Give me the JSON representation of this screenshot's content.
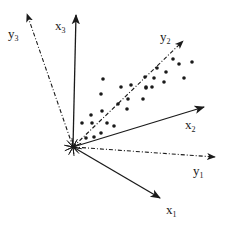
{
  "diagram": {
    "type": "coordinate-axes-rotation",
    "colors": {
      "ink": "#1a1a1a",
      "background": "#ffffff"
    },
    "origin": [
      73,
      147
    ],
    "axes": [
      {
        "id": "x1",
        "base": "x",
        "sub": "1",
        "style": "solid",
        "end": [
          160,
          198
        ],
        "label_pos": [
          166,
          214
        ]
      },
      {
        "id": "x2",
        "base": "x",
        "sub": "2",
        "style": "solid",
        "end": [
          204,
          107
        ],
        "label_pos": [
          185,
          129
        ]
      },
      {
        "id": "x3",
        "base": "x",
        "sub": "3",
        "style": "solid",
        "end": [
          76,
          15
        ],
        "label_pos": [
          55,
          30
        ]
      },
      {
        "id": "y1",
        "base": "y",
        "sub": "1",
        "style": "dashdot",
        "end": [
          215,
          157
        ],
        "label_pos": [
          193,
          175
        ]
      },
      {
        "id": "y2",
        "base": "y",
        "sub": "2",
        "style": "dashdot",
        "end": [
          183,
          41
        ],
        "label_pos": [
          160,
          41
        ]
      },
      {
        "id": "y3",
        "base": "y",
        "sub": "3",
        "style": "dashdot",
        "end": [
          27,
          14
        ],
        "label_pos": [
          8,
          38
        ]
      }
    ],
    "points": [
      [
        103,
        79
      ],
      [
        101,
        94
      ],
      [
        121,
        87
      ],
      [
        131,
        85
      ],
      [
        145,
        77
      ],
      [
        146,
        88
      ],
      [
        143,
        99
      ],
      [
        128,
        99
      ],
      [
        118,
        104
      ],
      [
        127,
        109
      ],
      [
        102,
        111
      ],
      [
        91,
        115
      ],
      [
        82,
        123
      ],
      [
        92,
        123
      ],
      [
        107,
        123
      ],
      [
        114,
        126
      ],
      [
        101,
        133
      ],
      [
        94,
        137
      ],
      [
        86,
        138
      ],
      [
        173,
        59
      ],
      [
        179,
        64
      ],
      [
        192,
        62
      ],
      [
        184,
        78
      ],
      [
        166,
        72
      ],
      [
        157,
        68
      ],
      [
        154,
        78
      ],
      [
        164,
        82
      ],
      [
        146,
        87
      ],
      [
        152,
        87
      ]
    ]
  }
}
